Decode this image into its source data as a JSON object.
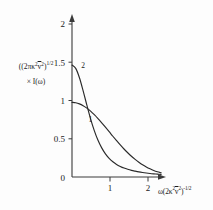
{
  "figure": {
    "background_color": "#fdfdfd",
    "ink_color": "#2a2a2a"
  },
  "chart_data": {
    "type": "line",
    "title": "",
    "xlabel": "ω(2κ² v̄²)^(-1/2)",
    "ylabel": "(2πκ² v̄²)^(1/2) × I(ω)",
    "xlim": [
      0,
      2.45
    ],
    "ylim": [
      0,
      2.05
    ],
    "grid": false,
    "legend": "inline-curve-labels",
    "xticks": [
      1,
      2
    ],
    "xtick_labels": [
      "1",
      "2"
    ],
    "yticks": [
      0,
      0.5,
      1,
      1.5,
      2
    ],
    "ytick_labels": [
      "0",
      "0.5",
      "1",
      "1.5",
      "2"
    ],
    "series": [
      {
        "name": "1",
        "label": "1",
        "label_x": 0.42,
        "label_y": 0.84,
        "description": "Gaussian-like lineshape, peak value 1.0 at origin, flat top, falls to zero near x=2.2",
        "x": [
          0.0,
          0.1,
          0.2,
          0.3,
          0.4,
          0.5,
          0.6,
          0.7,
          0.8,
          0.9,
          1.0,
          1.1,
          1.2,
          1.3,
          1.4,
          1.5,
          1.6,
          1.7,
          1.8,
          1.9,
          2.0,
          2.1,
          2.2,
          2.3,
          2.4
        ],
        "y": [
          1.0,
          0.995,
          0.98,
          0.956,
          0.923,
          0.882,
          0.835,
          0.783,
          0.726,
          0.667,
          0.607,
          0.546,
          0.487,
          0.429,
          0.375,
          0.325,
          0.278,
          0.236,
          0.198,
          0.164,
          0.135,
          0.11,
          0.088,
          0.07,
          0.055
        ]
      },
      {
        "name": "2",
        "label": "2",
        "label_x": 0.22,
        "label_y": 1.5,
        "description": "Peaked lineshape, peak value 1.5 at origin, steep decay, crosses curve 1 near x=0.55",
        "x": [
          0.0,
          0.1,
          0.2,
          0.3,
          0.4,
          0.5,
          0.6,
          0.7,
          0.8,
          0.9,
          1.0,
          1.1,
          1.2,
          1.3,
          1.4,
          1.5,
          1.6,
          1.7,
          1.8,
          1.9,
          2.0,
          2.1,
          2.2,
          2.3,
          2.4
        ],
        "y": [
          1.5,
          1.455,
          1.33,
          1.155,
          0.962,
          0.78,
          0.622,
          0.492,
          0.39,
          0.31,
          0.25,
          0.204,
          0.169,
          0.142,
          0.12,
          0.103,
          0.089,
          0.078,
          0.068,
          0.06,
          0.053,
          0.047,
          0.042,
          0.038,
          0.034
        ]
      }
    ]
  },
  "axis_label_parts": {
    "y_line1_open": "(2πκ",
    "y_line1_sup1": "2",
    "y_line1_v": "v",
    "y_line1_sup2": "2",
    "y_line1_close": ")",
    "y_line1_exp": "1/2",
    "y_line2": "× I(ω)",
    "x_omega": "ω",
    "x_open": "(2κ",
    "x_sup1": "2",
    "x_v": "v",
    "x_sup2": "2",
    "x_close": ")",
    "x_exp": "-1/2"
  }
}
